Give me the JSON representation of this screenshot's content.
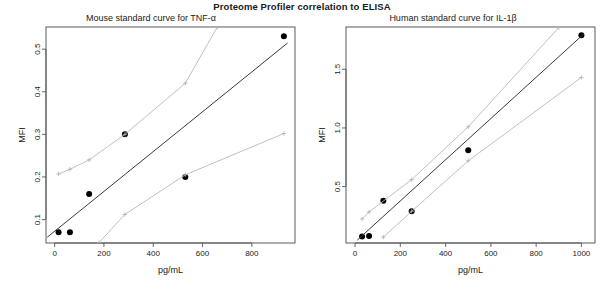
{
  "figure": {
    "title": "Proteome Profiler correlation to ELISA"
  },
  "panels": [
    {
      "key": "mouse",
      "title": "Mouse standard curve for TNF-α",
      "xlabel": "pg/mL",
      "ylabel": "MFI"
    },
    {
      "key": "human",
      "title": "Human standard curve for IL-1β",
      "xlabel": "pg/mL",
      "ylabel": "MFI"
    }
  ],
  "chart_data": [
    {
      "type": "scatter",
      "title": "Mouse standard curve for TNF-α",
      "subtitle": "Proteome Profiler correlation to ELISA",
      "xlabel": "pg/mL",
      "ylabel": "MFI",
      "xlim": [
        -35,
        975
      ],
      "ylim": [
        0.045,
        0.552
      ],
      "xticks": [
        0,
        200,
        400,
        600,
        800
      ],
      "xticklabels": [
        "0",
        "200",
        "400",
        "600",
        "800"
      ],
      "yticks": [
        0.1,
        0.2,
        0.3,
        0.4,
        0.5
      ],
      "yticklabels": [
        "0.1",
        "0.2",
        "0.3",
        "0.4",
        "0.5"
      ],
      "grid": false,
      "legend": "none",
      "series": [
        {
          "name": "observed points",
          "style": "filled-circle",
          "color": "#000000",
          "x": [
            16,
            62,
            140,
            285,
            530,
            930
          ],
          "y": [
            0.07,
            0.07,
            0.16,
            0.3,
            0.2,
            0.53
          ]
        },
        {
          "name": "regression fit",
          "style": "line",
          "color": "#3a3a3a",
          "x": [
            -30,
            945
          ],
          "y": [
            0.0585,
            0.5145
          ]
        },
        {
          "name": "upper band",
          "style": "line-plus",
          "color": "#b9b9b9",
          "x": [
            16,
            62,
            140,
            285,
            530,
            660
          ],
          "y": [
            0.207,
            0.218,
            0.24,
            0.3,
            0.42,
            0.552
          ]
        },
        {
          "name": "lower band",
          "style": "line-plus",
          "color": "#b9b9b9",
          "x": [
            180,
            285,
            530,
            930
          ],
          "y": [
            0.046,
            0.112,
            0.205,
            0.302
          ]
        }
      ]
    },
    {
      "type": "scatter",
      "title": "Human standard curve for IL-1β",
      "subtitle": "Proteome Profiler correlation to ELISA",
      "xlabel": "pg/mL",
      "ylabel": "MFI",
      "xlim": [
        -40,
        1060
      ],
      "ylim": [
        0.02,
        1.86
      ],
      "xticks": [
        0,
        200,
        400,
        600,
        800,
        1000
      ],
      "xticklabels": [
        "0",
        "200",
        "400",
        "600",
        "800",
        "1000"
      ],
      "yticks": [
        0.5,
        1.0,
        1.5
      ],
      "yticklabels": [
        "0.5",
        "1.0",
        "1.5"
      ],
      "grid": false,
      "legend": "none",
      "series": [
        {
          "name": "observed points",
          "style": "filled-circle",
          "color": "#000000",
          "x": [
            31,
            62,
            125,
            250,
            500,
            1000
          ],
          "y": [
            0.075,
            0.08,
            0.38,
            0.29,
            0.81,
            1.79
          ]
        },
        {
          "name": "regression fit",
          "style": "line",
          "color": "#3a3a3a",
          "x": [
            10,
            1010
          ],
          "y": [
            0.045,
            1.8
          ]
        },
        {
          "name": "upper band",
          "style": "line-plus",
          "color": "#b9b9b9",
          "x": [
            31,
            62,
            250,
            500,
            900
          ],
          "y": [
            0.225,
            0.285,
            0.56,
            1.01,
            1.855
          ]
        },
        {
          "name": "lower band",
          "style": "line-plus",
          "color": "#b9b9b9",
          "x": [
            125,
            250,
            500,
            1000
          ],
          "y": [
            0.07,
            0.29,
            0.72,
            1.43
          ]
        }
      ]
    }
  ]
}
